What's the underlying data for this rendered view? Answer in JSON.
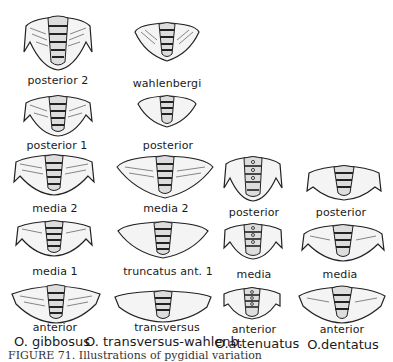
{
  "figure": {
    "columns": [
      {
        "species": "O. gibbosus",
        "specimens": [
          {
            "label": "posterior 2",
            "shape": "spined-deep"
          },
          {
            "label": "posterior 1",
            "shape": "spined"
          },
          {
            "label": "media 2",
            "shape": "spined-wide"
          },
          {
            "label": "media 1",
            "shape": "spined-wide"
          },
          {
            "label": "anterior",
            "shape": "flat-wide"
          }
        ]
      },
      {
        "species": "O. transversus-wahlenb.",
        "specimens": [
          {
            "label": "wahlenbergi",
            "shape": "triangular"
          },
          {
            "label": "posterior",
            "shape": "triangular-small"
          },
          {
            "label": "media 2",
            "shape": "triangular-wide"
          },
          {
            "label": "truncatus ant. 1",
            "shape": "triangular-wide"
          },
          {
            "label": "transversus",
            "shape": "flat-wide"
          }
        ]
      },
      {
        "species": "O.attenuatus",
        "specimens": [
          {
            "label": "posterior",
            "shape": "spined-deep"
          },
          {
            "label": "media",
            "shape": "spined"
          },
          {
            "label": "anterior",
            "shape": "spined-small"
          }
        ]
      },
      {
        "species": "O.dentatus",
        "specimens": [
          {
            "label": "posterior",
            "shape": "rounded-spined"
          },
          {
            "label": "media",
            "shape": "rounded-spined"
          },
          {
            "label": "anterior",
            "shape": "rounded-wide"
          }
        ]
      }
    ],
    "caption": "FIGURE 71.  Illustrations of pygidial variation"
  }
}
